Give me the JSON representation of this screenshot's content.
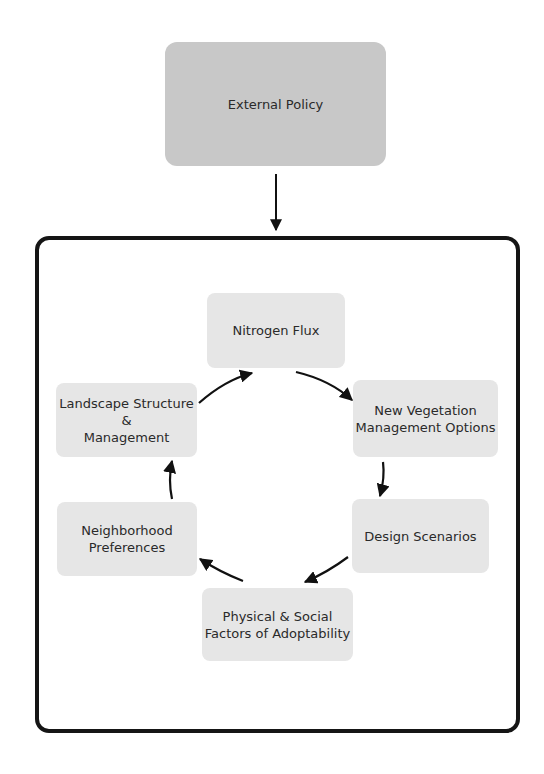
{
  "diagram": {
    "external": {
      "label": "External Policy",
      "color": "#c8c8c8"
    },
    "cycle": [
      {
        "id": "nitrogen",
        "label": "Nitrogen Flux"
      },
      {
        "id": "vegetation",
        "label": "New Vegetation\nManagement Options"
      },
      {
        "id": "design",
        "label": "Design Scenarios"
      },
      {
        "id": "physical",
        "label": "Physical & Social\nFactors of Adoptability"
      },
      {
        "id": "neighborhood",
        "label": "Neighborhood\nPreferences"
      },
      {
        "id": "landscape",
        "label": "Landscape Structure\n&\nManagement"
      }
    ],
    "node_color": "#e6e6e6",
    "edges": [
      {
        "from": "External Policy",
        "to": "system-frame"
      },
      {
        "from": "Nitrogen Flux",
        "to": "New Vegetation Management Options"
      },
      {
        "from": "New Vegetation Management Options",
        "to": "Design Scenarios"
      },
      {
        "from": "Design Scenarios",
        "to": "Physical & Social Factors of Adoptability"
      },
      {
        "from": "Physical & Social Factors of Adoptability",
        "to": "Neighborhood Preferences"
      },
      {
        "from": "Neighborhood Preferences",
        "to": "Landscape Structure & Management"
      },
      {
        "from": "Landscape Structure & Management",
        "to": "Nitrogen Flux"
      }
    ]
  }
}
